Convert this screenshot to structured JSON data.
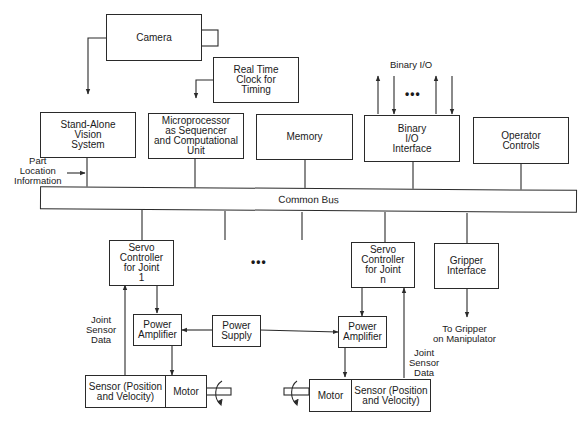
{
  "diagram": {
    "title": "",
    "blocks": {
      "camera": "Camera",
      "rtc": "Real Time\nClock for\nTiming",
      "vision": "Stand-Alone\nVision\nSystem",
      "micro": "Microprocessor\nas Sequencer\nand Computational\nUnit",
      "memory": "Memory",
      "binio": "Binary\nI/O\nInterface",
      "operator": "Operator\nControls",
      "bus": "Common Bus",
      "servo1": "Servo\nController\nfor Joint\n1",
      "servon": "Servo\nController\nfor Joint\nn",
      "gripper": "Gripper\nInterface",
      "amp1": "Power\nAmplifier",
      "ampn": "Power\nAmplifier",
      "supply": "Power\nSupply",
      "sensor1": "Sensor (Position\nand Velocity)",
      "motor1": "Motor",
      "motorn": "Motor",
      "sensorn": "Sensor (Position\nand Velocity)"
    },
    "labels": {
      "binary_io": "Binary I/O",
      "part_location": "Part\nLocation\nInformation",
      "joint_data_1": "Joint\nSensor\nData",
      "joint_data_n": "Joint\nSensor\nData",
      "to_gripper": "To Gripper\non Manipulator",
      "ellipsis_io": "•••",
      "ellipsis_joints": "•••"
    }
  }
}
